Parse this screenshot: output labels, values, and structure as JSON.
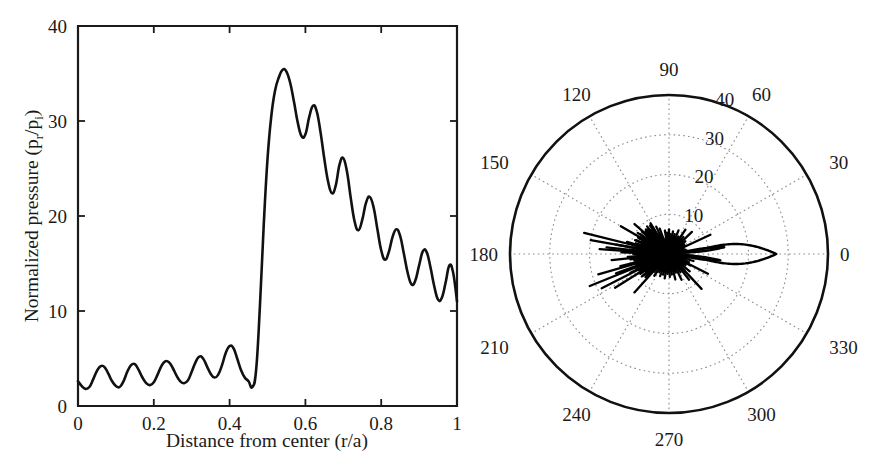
{
  "figure": {
    "background_color": "#ffffff",
    "line_color": "#111111",
    "grid_color": "#8c8c8c"
  },
  "chart_data": [
    {
      "type": "line",
      "panel": "left",
      "title": "",
      "xlabel": "Distance from center (r/a)",
      "ylabel": "Normalized pressure (p_r/p_i)",
      "ylabel_parts": {
        "prefix": "Normalized pressure (p",
        "sub1": "r",
        "mid": "/p",
        "sub2": "i",
        "suffix": ")"
      },
      "xlim": [
        0,
        1
      ],
      "ylim": [
        0,
        40
      ],
      "xticks": [
        0,
        0.2,
        0.4,
        0.6,
        0.8,
        1
      ],
      "xticklabels": [
        "0",
        "0.2",
        "0.4",
        "0.6",
        "0.8",
        "1"
      ],
      "yticks": [
        0,
        10,
        20,
        30,
        40
      ],
      "yticklabels": [
        "0",
        "10",
        "20",
        "30",
        "40"
      ],
      "grid": false,
      "legend": false,
      "series": [
        {
          "name": "normalized pressure",
          "x": [
            0.0,
            0.01,
            0.02,
            0.03,
            0.04,
            0.05,
            0.06,
            0.07,
            0.08,
            0.09,
            0.1,
            0.11,
            0.12,
            0.13,
            0.14,
            0.15,
            0.16,
            0.17,
            0.18,
            0.19,
            0.2,
            0.21,
            0.22,
            0.23,
            0.24,
            0.25,
            0.26,
            0.27,
            0.28,
            0.29,
            0.3,
            0.31,
            0.32,
            0.33,
            0.34,
            0.35,
            0.36,
            0.37,
            0.38,
            0.39,
            0.4,
            0.41,
            0.42,
            0.43,
            0.44,
            0.45,
            0.46,
            0.47,
            0.48,
            0.49,
            0.5,
            0.51,
            0.52,
            0.53,
            0.54,
            0.55,
            0.56,
            0.57,
            0.58,
            0.59,
            0.6,
            0.61,
            0.62,
            0.63,
            0.64,
            0.65,
            0.66,
            0.67,
            0.68,
            0.69,
            0.7,
            0.71,
            0.72,
            0.73,
            0.74,
            0.75,
            0.76,
            0.77,
            0.78,
            0.79,
            0.8,
            0.81,
            0.82,
            0.83,
            0.84,
            0.85,
            0.86,
            0.87,
            0.88,
            0.89,
            0.9,
            0.91,
            0.92,
            0.93,
            0.94,
            0.95,
            0.96,
            0.97,
            0.98,
            0.99,
            1.0
          ],
          "y": [
            2.6,
            2.1,
            1.8,
            2.0,
            2.8,
            3.7,
            4.2,
            4.1,
            3.4,
            2.6,
            2.1,
            2.0,
            2.6,
            3.6,
            4.3,
            4.4,
            3.8,
            3.0,
            2.4,
            2.2,
            2.5,
            3.3,
            4.2,
            4.7,
            4.6,
            4.0,
            3.2,
            2.6,
            2.4,
            2.7,
            3.6,
            4.6,
            5.2,
            5.0,
            4.2,
            3.4,
            3.0,
            3.3,
            4.3,
            5.6,
            6.3,
            6.1,
            5.0,
            3.8,
            3.0,
            2.6,
            2.0,
            3.8,
            10.5,
            19.0,
            26.0,
            30.5,
            33.2,
            34.6,
            35.4,
            35.2,
            34.0,
            32.0,
            29.8,
            28.4,
            28.6,
            30.4,
            31.6,
            31.0,
            28.8,
            26.0,
            23.6,
            22.4,
            23.2,
            25.4,
            26.1,
            24.6,
            21.8,
            19.4,
            18.5,
            19.6,
            21.4,
            22.0,
            20.9,
            18.6,
            16.4,
            15.4,
            16.2,
            17.8,
            18.6,
            17.9,
            16.0,
            14.0,
            12.8,
            13.2,
            14.8,
            16.3,
            16.2,
            14.6,
            12.6,
            11.2,
            11.4,
            13.0,
            14.8,
            14.0,
            11.0
          ]
        }
      ]
    },
    {
      "type": "polar",
      "panel": "right",
      "title": "",
      "rlim": [
        0,
        40
      ],
      "rticks": [
        10,
        20,
        30,
        40
      ],
      "rticklabels": [
        "10",
        "20",
        "30",
        "40"
      ],
      "rlabel_angle_deg": 75,
      "thetaticks_deg": [
        0,
        30,
        60,
        90,
        120,
        150,
        180,
        210,
        240,
        270,
        300,
        330
      ],
      "thetaticklabels": [
        "0",
        "30",
        "60",
        "90",
        "120",
        "150",
        "180",
        "210",
        "240",
        "270",
        "300",
        "330"
      ],
      "theta_direction": "counterclockwise",
      "theta_zero_location": "east",
      "grid": true,
      "legend": false,
      "description": "Scattering directivity pattern: large main lobe toward 0 degrees reaching r~27, paired narrow sidelobes near +/-8 degrees reaching r~14, and a dense fan of sharp spikes clustered around 150-210 degrees reaching r~8-16.",
      "main_lobe": {
        "direction_deg": 0,
        "peak_radius": 27,
        "half_width_deg": 11
      },
      "side_lobes": [
        {
          "direction_deg": 7,
          "peak_radius": 14
        },
        {
          "direction_deg": -7,
          "peak_radius": 13
        }
      ],
      "spikes": [
        {
          "angle_deg": 139,
          "radius": 11.5
        },
        {
          "angle_deg": 143,
          "radius": 7.0
        },
        {
          "angle_deg": 146,
          "radius": 9.5
        },
        {
          "angle_deg": 149,
          "radius": 6.2
        },
        {
          "angle_deg": 152,
          "radius": 8.8
        },
        {
          "angle_deg": 155,
          "radius": 6.0
        },
        {
          "angle_deg": 158,
          "radius": 9.2
        },
        {
          "angle_deg": 161,
          "radius": 7.4
        },
        {
          "angle_deg": 164,
          "radius": 11.0
        },
        {
          "angle_deg": 167,
          "radius": 7.8
        },
        {
          "angle_deg": 170,
          "radius": 13.5
        },
        {
          "angle_deg": 172,
          "radius": 8.0
        },
        {
          "angle_deg": 174,
          "radius": 15.8
        },
        {
          "angle_deg": 176,
          "radius": 8.6
        },
        {
          "angle_deg": 178,
          "radius": 12.0
        },
        {
          "angle_deg": 180,
          "radius": 9.0
        },
        {
          "angle_deg": 182,
          "radius": 7.2
        },
        {
          "angle_deg": 184,
          "radius": 10.4
        },
        {
          "angle_deg": 186,
          "radius": 6.8
        },
        {
          "angle_deg": 188,
          "radius": 9.8
        },
        {
          "angle_deg": 191,
          "radius": 7.0
        },
        {
          "angle_deg": 194,
          "radius": 12.6
        },
        {
          "angle_deg": 197,
          "radius": 6.4
        },
        {
          "angle_deg": 200,
          "radius": 14.2
        },
        {
          "angle_deg": 203,
          "radius": 7.6
        },
        {
          "angle_deg": 206,
          "radius": 10.8
        },
        {
          "angle_deg": 209,
          "radius": 6.6
        },
        {
          "angle_deg": 212,
          "radius": 9.0
        },
        {
          "angle_deg": 216,
          "radius": 7.2
        },
        {
          "angle_deg": 220,
          "radius": 8.4
        },
        {
          "angle_deg": 121,
          "radius": 9.0
        },
        {
          "angle_deg": 126,
          "radius": 6.6
        },
        {
          "angle_deg": 131,
          "radius": 8.2
        },
        {
          "angle_deg": 135,
          "radius": 6.0
        },
        {
          "angle_deg": 110,
          "radius": 6.8
        },
        {
          "angle_deg": 115,
          "radius": 7.6
        },
        {
          "angle_deg": 100,
          "radius": 6.0
        },
        {
          "angle_deg": 95,
          "radius": 5.4
        },
        {
          "angle_deg": 90,
          "radius": 6.2
        },
        {
          "angle_deg": 85,
          "radius": 5.0
        },
        {
          "angle_deg": 80,
          "radius": 5.8
        },
        {
          "angle_deg": 74,
          "radius": 5.2
        },
        {
          "angle_deg": 68,
          "radius": 6.4
        },
        {
          "angle_deg": 62,
          "radius": 5.0
        },
        {
          "angle_deg": 56,
          "radius": 7.4
        },
        {
          "angle_deg": 50,
          "radius": 5.6
        },
        {
          "angle_deg": 44,
          "radius": 8.0
        },
        {
          "angle_deg": 38,
          "radius": 5.2
        },
        {
          "angle_deg": 225,
          "radius": 7.0
        },
        {
          "angle_deg": 230,
          "radius": 5.8
        },
        {
          "angle_deg": 236,
          "radius": 6.6
        },
        {
          "angle_deg": 242,
          "radius": 5.2
        },
        {
          "angle_deg": 248,
          "radius": 6.0
        },
        {
          "angle_deg": 254,
          "radius": 5.4
        },
        {
          "angle_deg": 260,
          "radius": 6.2
        },
        {
          "angle_deg": 266,
          "radius": 5.0
        },
        {
          "angle_deg": 272,
          "radius": 5.8
        },
        {
          "angle_deg": 278,
          "radius": 5.2
        },
        {
          "angle_deg": 284,
          "radius": 6.6
        },
        {
          "angle_deg": 290,
          "radius": 5.0
        },
        {
          "angle_deg": 296,
          "radius": 7.2
        },
        {
          "angle_deg": 302,
          "radius": 5.4
        },
        {
          "angle_deg": 308,
          "radius": 8.2
        },
        {
          "angle_deg": 314,
          "radius": 5.6
        },
        {
          "angle_deg": 320,
          "radius": 6.8
        },
        {
          "angle_deg": 326,
          "radius": 5.0
        },
        {
          "angle_deg": 332,
          "radius": 6.0
        },
        {
          "angle_deg": 338,
          "radius": 5.4
        },
        {
          "angle_deg": 344,
          "radius": 6.4
        },
        {
          "angle_deg": 350,
          "radius": 5.2
        },
        {
          "angle_deg": 356,
          "radius": 6.0
        }
      ],
      "long_spikes": [
        {
          "angle_deg": 166,
          "radius": 22.0
        },
        {
          "angle_deg": 170,
          "radius": 20.0
        },
        {
          "angle_deg": 176,
          "radius": 17.5
        },
        {
          "angle_deg": 196,
          "radius": 18.5
        },
        {
          "angle_deg": 202,
          "radius": 21.5
        },
        {
          "angle_deg": 207,
          "radius": 19.0
        },
        {
          "angle_deg": 212,
          "radius": 16.0
        },
        {
          "angle_deg": 150,
          "radius": 14.0
        },
        {
          "angle_deg": 186,
          "radius": 14.5
        },
        {
          "angle_deg": 228,
          "radius": 13.0
        },
        {
          "angle_deg": 25,
          "radius": 11.5
        },
        {
          "angle_deg": 333,
          "radius": 11.0
        },
        {
          "angle_deg": 313,
          "radius": 12.0
        }
      ]
    }
  ]
}
